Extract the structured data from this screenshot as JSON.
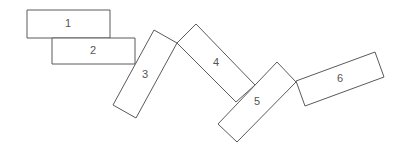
{
  "diagram": {
    "type": "chain of rotated rectangles",
    "stroke_color": "#5a5a5a",
    "text_color": "#555555",
    "background": "#ffffff",
    "blocks": [
      {
        "label": "1",
        "points": "27,10 110,10 110,38 27,38",
        "label_x": 68,
        "label_y": 24
      },
      {
        "label": "2",
        "points": "52,38 135,38 135,64 52,64",
        "label_x": 93,
        "label_y": 51
      },
      {
        "label": "3",
        "points": "154,30 177,43 136,118 113,105",
        "label_x": 145,
        "label_y": 75
      },
      {
        "label": "4",
        "points": "196,24 255,85 236,102 177,43",
        "label_x": 216,
        "label_y": 63
      },
      {
        "label": "5",
        "points": "277,62 296,82 237,142 218,124",
        "label_x": 257,
        "label_y": 102
      },
      {
        "label": "6",
        "points": "296,81 375,52 384,77 305,106",
        "label_x": 340,
        "label_y": 79
      }
    ]
  }
}
